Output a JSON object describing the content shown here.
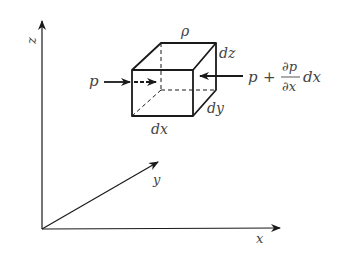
{
  "diagram": {
    "axes": {
      "z_label": "z",
      "x_label": "x",
      "y_label": "y"
    },
    "element": {
      "density_label": "ρ",
      "dx_label": "dx",
      "dy_label": "dy",
      "dz_label": "dz"
    },
    "forces": {
      "left_label": "p",
      "right_p": "p",
      "right_plus": "+",
      "right_partial_num": "∂p",
      "right_partial_den": "∂x",
      "right_dx": "dx"
    },
    "colors": {
      "line": "#1a1a1a",
      "text": "#444444"
    }
  }
}
